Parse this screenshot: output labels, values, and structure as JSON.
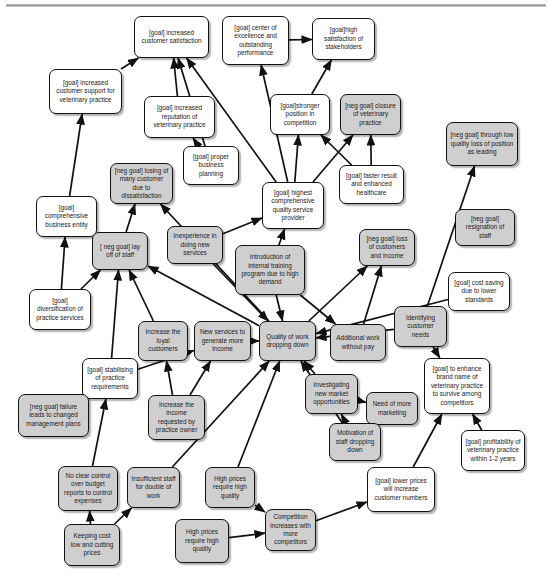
{
  "diagram": {
    "type": "goal-graph",
    "legend": {
      "goal_fill": "#ffffff",
      "negative_fill": "#cfcfcf",
      "stroke": "#111111"
    },
    "nodes": [
      {
        "id": "n1",
        "label": "[goal] increased customer satisfaction",
        "kind": "goal",
        "x": 134,
        "y": 16,
        "w": 75,
        "h": 42
      },
      {
        "id": "n2",
        "label": "[goal] center of excellence and outstanding performance",
        "kind": "goal",
        "x": 222,
        "y": 16,
        "w": 67,
        "h": 49
      },
      {
        "id": "n3",
        "label": "[goal]high satisfaction of stakeholders",
        "kind": "goal",
        "x": 312,
        "y": 18,
        "w": 63,
        "h": 42
      },
      {
        "id": "n4",
        "label": "[goal] increased customer support for veterinary practice",
        "kind": "goal",
        "x": 49,
        "y": 69,
        "w": 73,
        "h": 45
      },
      {
        "id": "n5",
        "label": "[goal] increased reputation of veterinary practice",
        "kind": "goal",
        "x": 144,
        "y": 96,
        "w": 71,
        "h": 42
      },
      {
        "id": "n6",
        "label": "[goal]stronger position in competition",
        "kind": "goal",
        "x": 270,
        "y": 94,
        "w": 60,
        "h": 41
      },
      {
        "id": "n7",
        "label": "[neg goal] closure of veterinary practice",
        "kind": "soft",
        "x": 340,
        "y": 94,
        "w": 61,
        "h": 41
      },
      {
        "id": "n8",
        "label": "[neg goal] through low quality loss of position as leading",
        "kind": "soft",
        "x": 446,
        "y": 122,
        "w": 72,
        "h": 44
      },
      {
        "id": "n9",
        "label": "[goal] proper business planning",
        "kind": "goal",
        "x": 183,
        "y": 146,
        "w": 56,
        "h": 39
      },
      {
        "id": "n10",
        "label": "[neg goal] losing of many customer due to dissatisfaction",
        "kind": "soft",
        "x": 110,
        "y": 163,
        "w": 63,
        "h": 41
      },
      {
        "id": "n11",
        "label": "[goal] faster result and enhanced healthcare",
        "kind": "goal",
        "x": 339,
        "y": 165,
        "w": 65,
        "h": 39
      },
      {
        "id": "n12",
        "label": "[goal] highest comprehensive quality service provider",
        "kind": "goal",
        "x": 262,
        "y": 182,
        "w": 62,
        "h": 47
      },
      {
        "id": "n13",
        "label": "[goal] comprehensive business entity",
        "kind": "goal",
        "x": 36,
        "y": 196,
        "w": 61,
        "h": 41
      },
      {
        "id": "n14",
        "label": "[neg goal] resignation of staff",
        "kind": "soft",
        "x": 455,
        "y": 209,
        "w": 60,
        "h": 37
      },
      {
        "id": "n15",
        "label": "[ neg goal] lay off of staff",
        "kind": "soft",
        "x": 92,
        "y": 232,
        "w": 56,
        "h": 38
      },
      {
        "id": "n16",
        "label": "Inexperience in doing new services",
        "kind": "soft",
        "x": 167,
        "y": 226,
        "w": 56,
        "h": 38
      },
      {
        "id": "n17",
        "label": "[neg goal] loss of customers and income",
        "kind": "soft",
        "x": 359,
        "y": 229,
        "w": 56,
        "h": 37
      },
      {
        "id": "n18",
        "label": "Introduction of internal training program due to high demand",
        "kind": "soft",
        "x": 235,
        "y": 245,
        "w": 70,
        "h": 50
      },
      {
        "id": "n19",
        "label": "[goal] cost saving due to lower standards",
        "kind": "goal",
        "x": 448,
        "y": 272,
        "w": 62,
        "h": 39
      },
      {
        "id": "n20",
        "label": "[goal] diversification of practice services",
        "kind": "goal",
        "x": 29,
        "y": 289,
        "w": 62,
        "h": 41
      },
      {
        "id": "n21",
        "label": "Identifying customer needs",
        "kind": "soft",
        "x": 394,
        "y": 306,
        "w": 53,
        "h": 41
      },
      {
        "id": "n22",
        "label": "Increase the loyal customers",
        "kind": "soft",
        "x": 138,
        "y": 321,
        "w": 50,
        "h": 40
      },
      {
        "id": "n23",
        "label": "New services to generate more income",
        "kind": "soft",
        "x": 194,
        "y": 321,
        "w": 57,
        "h": 40
      },
      {
        "id": "n24",
        "label": "Quality of work dropping down",
        "kind": "soft",
        "x": 259,
        "y": 321,
        "w": 57,
        "h": 40
      },
      {
        "id": "n25",
        "label": "Additional work without pay",
        "kind": "soft",
        "x": 330,
        "y": 324,
        "w": 56,
        "h": 37
      },
      {
        "id": "n26",
        "label": "[goal] stabilising of practice requirements",
        "kind": "goal",
        "x": 82,
        "y": 358,
        "w": 56,
        "h": 41
      },
      {
        "id": "n27",
        "label": "[goal] to enhance brand name of veterinary practice to survive among competitors",
        "kind": "goal",
        "x": 424,
        "y": 358,
        "w": 66,
        "h": 56
      },
      {
        "id": "n28",
        "label": "Investigating new market opportunities",
        "kind": "soft",
        "x": 305,
        "y": 374,
        "w": 53,
        "h": 40
      },
      {
        "id": "n29",
        "label": "Need of more marketing",
        "kind": "soft",
        "x": 366,
        "y": 392,
        "w": 52,
        "h": 33
      },
      {
        "id": "n30",
        "label": "[neg goal] failure leads to changed management plans",
        "kind": "soft",
        "x": 18,
        "y": 394,
        "w": 71,
        "h": 43
      },
      {
        "id": "n31",
        "label": "Increase the income requested by practice owner",
        "kind": "soft",
        "x": 148,
        "y": 395,
        "w": 57,
        "h": 45
      },
      {
        "id": "n32",
        "label": "Motivation of staff dropping down",
        "kind": "soft",
        "x": 329,
        "y": 423,
        "w": 52,
        "h": 38
      },
      {
        "id": "n33",
        "label": "[goal] profitability of veterinary practice within 1-2 years",
        "kind": "goal",
        "x": 461,
        "y": 430,
        "w": 64,
        "h": 41
      },
      {
        "id": "n34",
        "label": "[goal] lower prices will increase customer numbers",
        "kind": "goal",
        "x": 367,
        "y": 467,
        "w": 68,
        "h": 45
      },
      {
        "id": "n35",
        "label": "No clear control over budget reports to control expenses",
        "kind": "soft",
        "x": 58,
        "y": 466,
        "w": 60,
        "h": 45
      },
      {
        "id": "n36",
        "label": "Insufficient staff for double of work",
        "kind": "soft",
        "x": 127,
        "y": 467,
        "w": 53,
        "h": 41
      },
      {
        "id": "n37",
        "label": "High prices require high quality",
        "kind": "soft",
        "x": 205,
        "y": 467,
        "w": 50,
        "h": 41
      },
      {
        "id": "n38",
        "label": "Competition increases with more competitors",
        "kind": "soft",
        "x": 265,
        "y": 509,
        "w": 51,
        "h": 42
      },
      {
        "id": "n39",
        "label": "Keeping cost low and cutting prices",
        "kind": "soft",
        "x": 64,
        "y": 524,
        "w": 56,
        "h": 42
      },
      {
        "id": "n40",
        "label": "High prices require high quality",
        "kind": "soft",
        "x": 175,
        "y": 519,
        "w": 54,
        "h": 44
      }
    ],
    "edges": [
      {
        "from": "n4",
        "to": "n1"
      },
      {
        "from": "n5",
        "to": "n1"
      },
      {
        "from": "n9",
        "to": "n1"
      },
      {
        "from": "n12",
        "to": "n1"
      },
      {
        "from": "n2",
        "to": "n3"
      },
      {
        "from": "n12",
        "to": "n2"
      },
      {
        "from": "n6",
        "to": "n3"
      },
      {
        "from": "n13",
        "to": "n4"
      },
      {
        "from": "n9",
        "to": "n5"
      },
      {
        "from": "n12",
        "to": "n6"
      },
      {
        "from": "n11",
        "to": "n6"
      },
      {
        "from": "n12",
        "to": "n7"
      },
      {
        "from": "n11",
        "to": "n7"
      },
      {
        "from": "n21",
        "to": "n8"
      },
      {
        "from": "n20",
        "to": "n13"
      },
      {
        "from": "n26",
        "to": "n15"
      },
      {
        "from": "n20",
        "to": "n15"
      },
      {
        "from": "n22",
        "to": "n15"
      },
      {
        "from": "n24",
        "to": "n15"
      },
      {
        "from": "n15",
        "to": "n10"
      },
      {
        "from": "n24",
        "to": "n10"
      },
      {
        "from": "n16",
        "to": "n12"
      },
      {
        "from": "n18",
        "to": "n12"
      },
      {
        "from": "n18",
        "to": "n24"
      },
      {
        "from": "n16",
        "to": "n24"
      },
      {
        "from": "n23",
        "to": "n24"
      },
      {
        "from": "n25",
        "to": "n17"
      },
      {
        "from": "n24",
        "to": "n17"
      },
      {
        "from": "n18",
        "to": "n25"
      },
      {
        "from": "n21",
        "to": "n24"
      },
      {
        "from": "n19",
        "to": "n24"
      },
      {
        "from": "n31",
        "to": "n22"
      },
      {
        "from": "n31",
        "to": "n23"
      },
      {
        "from": "n26",
        "to": "n23"
      },
      {
        "from": "n30",
        "to": "n26"
      },
      {
        "from": "n35",
        "to": "n26"
      },
      {
        "from": "n28",
        "to": "n24"
      },
      {
        "from": "n28",
        "to": "n29"
      },
      {
        "from": "n32",
        "to": "n28"
      },
      {
        "from": "n32",
        "to": "n24"
      },
      {
        "from": "n34",
        "to": "n27"
      },
      {
        "from": "n33",
        "to": "n27"
      },
      {
        "from": "n21",
        "to": "n27"
      },
      {
        "from": "n39",
        "to": "n35"
      },
      {
        "from": "n39",
        "to": "n36"
      },
      {
        "from": "n37",
        "to": "n38"
      },
      {
        "from": "n40",
        "to": "n38"
      },
      {
        "from": "n38",
        "to": "n34"
      },
      {
        "from": "n37",
        "to": "n24"
      },
      {
        "from": "n36",
        "to": "n24"
      }
    ]
  }
}
